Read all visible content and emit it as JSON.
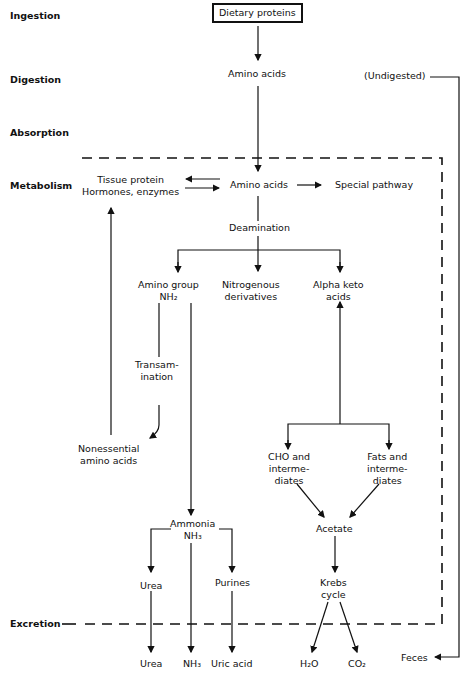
{
  "stages": {
    "ingestion": "Ingestion",
    "digestion": "Digestion",
    "absorption": "Absorption",
    "metabolism": "Metabolism",
    "excretion": "Excretion"
  },
  "nodes": {
    "dietary_proteins": "Dietary proteins",
    "amino_acids_digest": "Amino acids",
    "undigested": "(Undigested)",
    "tissue_protein": "Tissue protein",
    "hormones_enzymes": "Hormones, enzymes",
    "amino_acids_pool": "Amino acids",
    "special_pathway": "Special pathway",
    "deamination": "Deamination",
    "amino_group_1": "Amino group",
    "amino_group_2": "NH₂",
    "nitrogenous_1": "Nitrogenous",
    "nitrogenous_2": "derivatives",
    "alpha_keto_1": "Alpha keto",
    "alpha_keto_2": "acids",
    "transamination_1": "Transam-",
    "transamination_2": "ination",
    "nonessential_1": "Nonessential",
    "nonessential_2": "amino acids",
    "cho_1": "CHO and",
    "cho_2": "interme-",
    "cho_3": "diates",
    "fats_1": "Fats and",
    "fats_2": "interme-",
    "fats_3": "diates",
    "ammonia_1": "Ammonia",
    "ammonia_2": "NH₃",
    "acetate": "Acetate",
    "urea_mid": "Urea",
    "purines": "Purines",
    "krebs_1": "Krebs",
    "krebs_2": "cycle",
    "urea_out": "Urea",
    "nh3_out": "NH₃",
    "uric_acid": "Uric acid",
    "h2o": "H₂O",
    "co2": "CO₂",
    "feces": "Feces"
  }
}
